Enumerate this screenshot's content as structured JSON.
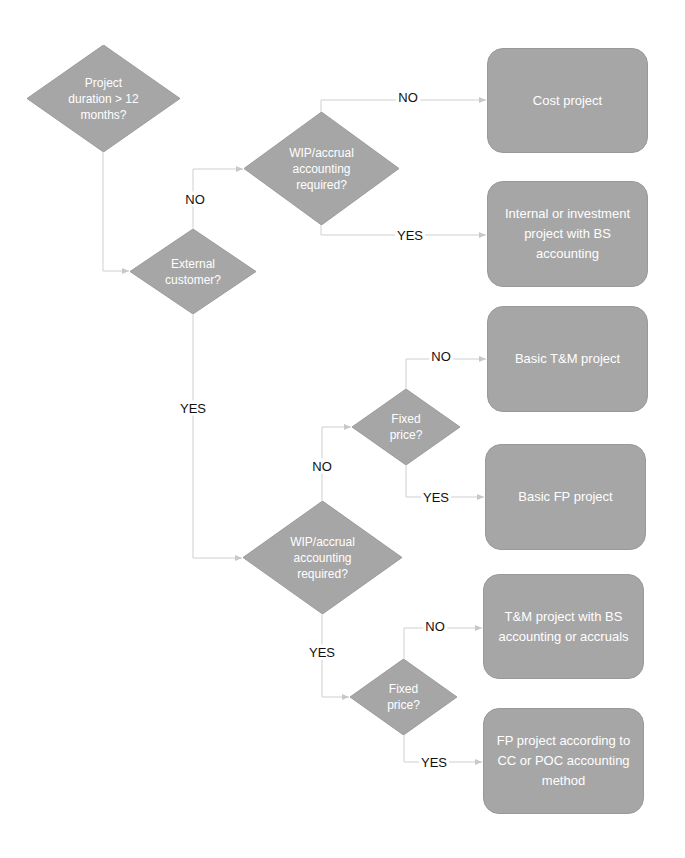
{
  "colors": {
    "shape_fill": "#a6a6a6",
    "shape_text": "#ffffff",
    "connector": "#cccccc",
    "label_text": "#111111"
  },
  "decisions": {
    "duration": {
      "lines": [
        "Project",
        "duration > 12",
        "months?"
      ]
    },
    "wip_upper": {
      "lines": [
        "WIP/accrual",
        "accounting",
        "required?"
      ]
    },
    "external": {
      "lines": [
        "External",
        "customer?"
      ]
    },
    "fixed_upper": {
      "lines": [
        "Fixed",
        "price?"
      ]
    },
    "wip_lower": {
      "lines": [
        "WIP/accrual",
        "accounting",
        "required?"
      ]
    },
    "fixed_lower": {
      "lines": [
        "Fixed",
        "price?"
      ]
    }
  },
  "outcomes": {
    "cost_project": "Cost project",
    "internal_project": "Internal or investment project with BS accounting",
    "basic_tm": "Basic T&M project",
    "basic_fp": "Basic FP project",
    "tm_bs": "T&M project with BS accounting or accruals",
    "fp_cc_poc": "FP project according to CC or POC accounting method"
  },
  "labels": {
    "upper_wip_no": "NO",
    "upper_wip_yes": "YES",
    "external_no": "NO",
    "external_yes": "YES",
    "fixed_upper_no": "NO",
    "fixed_upper_yes": "YES",
    "lower_wip_no": "NO",
    "lower_wip_yes": "YES",
    "fixed_lower_no": "NO",
    "fixed_lower_yes": "YES"
  }
}
